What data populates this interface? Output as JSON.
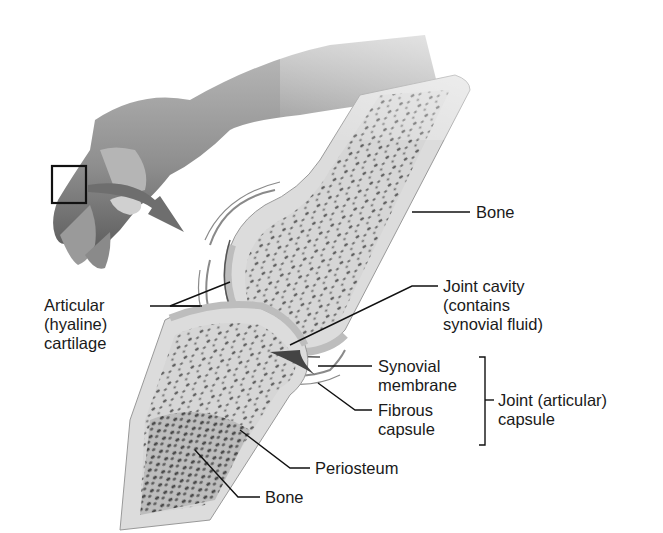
{
  "diagram": {
    "inset": {
      "description": "Hand with box highlighting finger joint; arrow indicating flexion",
      "icon": "zoom-box-icon"
    },
    "labels": {
      "bone_upper": "Bone",
      "joint_cavity": [
        "Joint cavity",
        "(contains",
        "synovial fluid)"
      ],
      "articular_cartilage": [
        "Articular",
        "(hyaline)",
        "cartilage"
      ],
      "synovial_membrane": [
        "Synovial",
        "membrane"
      ],
      "fibrous_capsule": [
        "Fibrous",
        "capsule"
      ],
      "joint_capsule": [
        "Joint (articular)",
        "capsule"
      ],
      "periosteum": "Periosteum",
      "bone_lower": "Bone"
    },
    "colors": {
      "background": "#ffffff",
      "text": "#1a1a1a",
      "bone_fill": "#d9d9d9",
      "spongy_bone": "#5a5a5a",
      "skin": "#8c8c8c",
      "cartilage": "#c8c8c8"
    }
  }
}
